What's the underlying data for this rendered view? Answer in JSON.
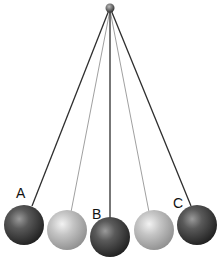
{
  "diagram": {
    "type": "pendulum",
    "pivot": {
      "x": 110,
      "y": 8,
      "r": 4
    },
    "colors": {
      "dark_ball": "#3a3a3a",
      "light_ball": "#b8b8b8",
      "string_dark": "#333333",
      "string_light": "#9a9a9a"
    },
    "positions": [
      {
        "id": "A",
        "label": "A",
        "shade": "dark",
        "x": 24,
        "y": 225,
        "r": 20,
        "label_x": 16,
        "label_y": 198
      },
      {
        "id": "mid-left",
        "label": "",
        "shade": "light",
        "x": 67,
        "y": 230,
        "r": 20
      },
      {
        "id": "B",
        "label": "B",
        "shade": "dark",
        "x": 110,
        "y": 237,
        "r": 20,
        "label_x": 92,
        "label_y": 219
      },
      {
        "id": "mid-right",
        "label": "",
        "shade": "light",
        "x": 154,
        "y": 230,
        "r": 20
      },
      {
        "id": "C",
        "label": "C",
        "shade": "dark",
        "x": 197,
        "y": 225,
        "r": 20,
        "label_x": 173,
        "label_y": 208
      }
    ]
  },
  "labels": {
    "a": "A",
    "b": "B",
    "c": "C"
  }
}
